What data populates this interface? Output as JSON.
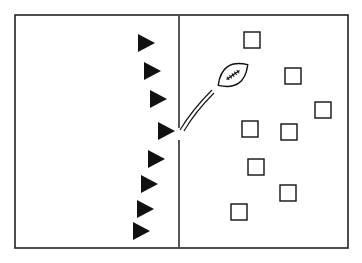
{
  "diagram": {
    "type": "football-play-diagram",
    "colors": {
      "background": "#ffffff",
      "ink": "#111111",
      "frame": "#222222"
    },
    "field": {
      "frame": {
        "x1": 15,
        "y1": 15,
        "x2": 348,
        "y2": 248
      },
      "line_of_scrimmage": {
        "x": 179,
        "y1": 16,
        "y2": 247,
        "gap_y1": 128,
        "gap_y2": 140
      }
    },
    "offense": {
      "symbol": "triangle-right",
      "players": [
        {
          "x": 138,
          "y": 34
        },
        {
          "x": 144,
          "y": 62
        },
        {
          "x": 150,
          "y": 90
        },
        {
          "x": 158,
          "y": 122
        },
        {
          "x": 148,
          "y": 150
        },
        {
          "x": 141,
          "y": 175
        },
        {
          "x": 137,
          "y": 200
        },
        {
          "x": 133,
          "y": 222
        }
      ]
    },
    "defense": {
      "symbol": "square",
      "size": 16,
      "players": [
        {
          "x": 244,
          "y": 32
        },
        {
          "x": 285,
          "y": 68
        },
        {
          "x": 315,
          "y": 102
        },
        {
          "x": 242,
          "y": 121
        },
        {
          "x": 281,
          "y": 124
        },
        {
          "x": 248,
          "y": 159
        },
        {
          "x": 280,
          "y": 185
        },
        {
          "x": 231,
          "y": 204
        }
      ]
    },
    "ball": {
      "symbol": "football",
      "cx": 233,
      "cy": 75,
      "rx": 18,
      "ry": 10,
      "rotate": -35
    },
    "ball_path": {
      "symbol": "double-motion-line",
      "from": {
        "x": 180,
        "y": 130
      },
      "to": {
        "x": 212,
        "y": 90
      }
    }
  }
}
